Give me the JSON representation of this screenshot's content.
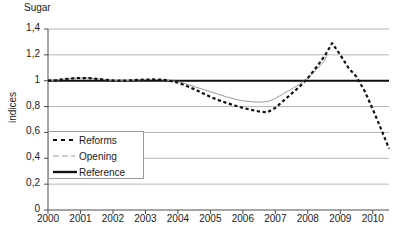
{
  "chart_data": {
    "type": "line",
    "title": "Sugar",
    "xlabel": "",
    "ylabel": "indices",
    "xlim": [
      2000,
      2010.5
    ],
    "ylim": [
      0,
      1.4
    ],
    "grid": true,
    "legend_position": "inside-left",
    "xticks": [
      "2000",
      "2001",
      "2002",
      "2003",
      "2004",
      "2005",
      "2006",
      "2007",
      "2008",
      "2009",
      "2010"
    ],
    "yticks": [
      "0",
      "0,2",
      "0,4",
      "0,6",
      "0,8",
      "1",
      "1,2",
      "1,4"
    ],
    "ytick_values": [
      0,
      0.2,
      0.4,
      0.6,
      0.8,
      1.0,
      1.2,
      1.4
    ],
    "series": [
      {
        "name": "Reforms",
        "style": "dashed",
        "color": "#111111",
        "width": 2.2,
        "x": [
          2000,
          2000.25,
          2000.5,
          2000.75,
          2001,
          2001.25,
          2001.5,
          2001.75,
          2002,
          2002.25,
          2002.5,
          2002.75,
          2003,
          2003.25,
          2003.5,
          2003.75,
          2004,
          2004.25,
          2004.5,
          2004.75,
          2005,
          2005.25,
          2005.5,
          2005.75,
          2006,
          2006.25,
          2006.5,
          2006.75,
          2007,
          2007.25,
          2007.5,
          2007.75,
          2008,
          2008.25,
          2008.5,
          2008.75,
          2009,
          2009.25,
          2009.5,
          2009.75,
          2010,
          2010.25,
          2010.5
        ],
        "values": [
          1.0,
          1.005,
          1.012,
          1.018,
          1.021,
          1.02,
          1.015,
          1.008,
          1.002,
          1.0,
          1.002,
          1.006,
          1.009,
          1.01,
          1.008,
          1.0,
          0.985,
          0.962,
          0.935,
          0.905,
          0.875,
          0.85,
          0.828,
          0.808,
          0.79,
          0.775,
          0.762,
          0.755,
          0.79,
          0.845,
          0.9,
          0.955,
          1.02,
          1.1,
          1.185,
          1.29,
          1.2,
          1.1,
          1.03,
          0.92,
          0.78,
          0.63,
          0.475
        ]
      },
      {
        "name": "Opening",
        "style": "solid-thin",
        "color": "#9a9a9a",
        "width": 1,
        "x": [
          2000,
          2000.25,
          2000.5,
          2000.75,
          2001,
          2001.25,
          2001.5,
          2001.75,
          2002,
          2002.25,
          2002.5,
          2002.75,
          2003,
          2003.25,
          2003.5,
          2003.75,
          2004,
          2004.25,
          2004.5,
          2004.75,
          2005,
          2005.25,
          2005.5,
          2005.75,
          2006,
          2006.25,
          2006.5,
          2006.75,
          2007,
          2007.25,
          2007.5,
          2007.75,
          2008,
          2008.25,
          2008.5,
          2008.6
        ],
        "values": [
          1.0,
          1.005,
          1.012,
          1.018,
          1.021,
          1.02,
          1.015,
          1.008,
          1.002,
          1.0,
          1.002,
          1.006,
          1.009,
          1.01,
          1.008,
          1.002,
          0.993,
          0.975,
          0.955,
          0.935,
          0.915,
          0.895,
          0.875,
          0.858,
          0.845,
          0.838,
          0.834,
          0.838,
          0.862,
          0.9,
          0.935,
          0.975,
          1.02,
          1.08,
          1.15,
          1.205
        ]
      },
      {
        "name": "Reference",
        "style": "solid-thick",
        "color": "#111111",
        "width": 2,
        "x": [
          2000,
          2010.5
        ],
        "values": [
          1.0,
          1.0
        ]
      }
    ]
  },
  "legend": {
    "items": [
      {
        "label": "Reforms"
      },
      {
        "label": "Opening"
      },
      {
        "label": "Reference"
      }
    ]
  }
}
